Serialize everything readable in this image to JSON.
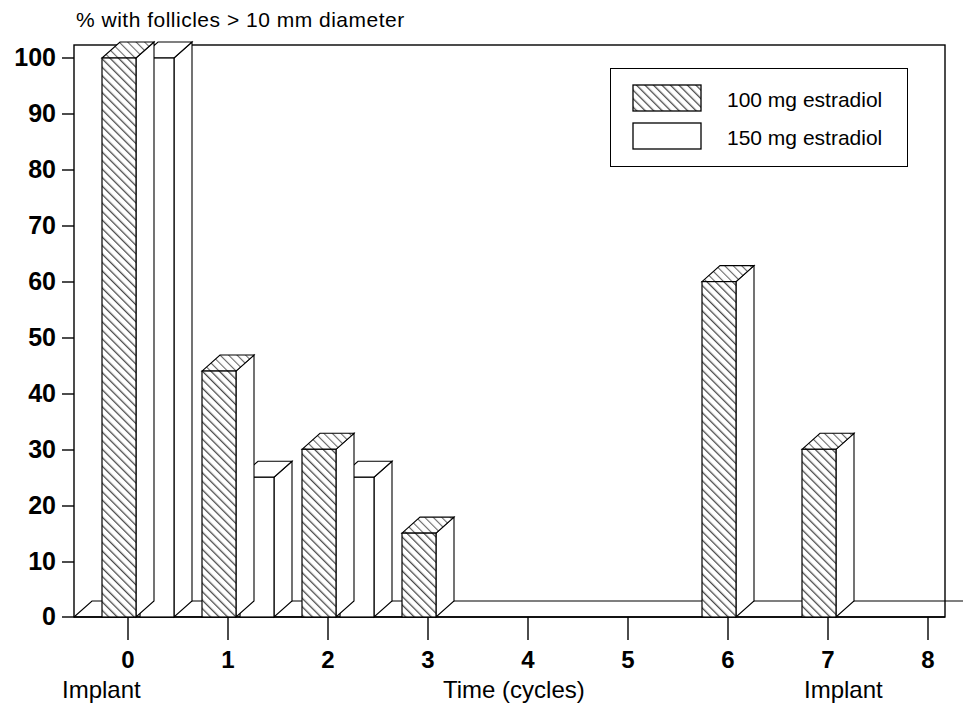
{
  "chart_data": {
    "type": "bar",
    "title": "% with follicles > 10 mm diameter",
    "xlabel": "Time (cycles)",
    "ylabel": "",
    "categories": [
      "0",
      "1",
      "2",
      "3",
      "4",
      "5",
      "6",
      "7",
      "8"
    ],
    "x": [
      0,
      1,
      2,
      3,
      4,
      5,
      6,
      7,
      8
    ],
    "series": [
      {
        "name": "100 mg estradiol",
        "fill": "hatched",
        "values": [
          100,
          44,
          30,
          15,
          0,
          0,
          60,
          30,
          0
        ]
      },
      {
        "name": "150 mg estradiol",
        "fill": "white",
        "values": [
          100,
          25,
          25,
          0,
          0,
          0,
          0,
          0,
          0
        ]
      }
    ],
    "ylim": [
      0,
      100
    ],
    "ytick_values": [
      0,
      10,
      20,
      30,
      40,
      50,
      60,
      70,
      80,
      90,
      100
    ],
    "xlim": [
      -0.5,
      8.5
    ],
    "grid": false,
    "legend_position": "top-right",
    "style": "3d-bars",
    "annotations": [
      {
        "text": "Implant",
        "x": 0
      },
      {
        "text": "Implant",
        "x": 7.5
      }
    ]
  },
  "yaxis": {
    "ticks": [
      "100",
      "90",
      "80",
      "70",
      "60",
      "50",
      "40",
      "30",
      "20",
      "10",
      "0"
    ]
  },
  "xaxis": {
    "ticks": [
      "0",
      "1",
      "2",
      "3",
      "4",
      "5",
      "6",
      "7",
      "8"
    ],
    "caption_center": "Time (cycles)",
    "caption_left": "Implant",
    "caption_right": "Implant"
  },
  "legend": {
    "items": [
      {
        "label": "100 mg estradiol",
        "swatch": "hatched-swatch"
      },
      {
        "label": "150 mg estradiol",
        "swatch": "white-swatch"
      }
    ]
  },
  "colors": {
    "ink": "#000000",
    "background": "#ffffff",
    "bar_face_100": "#ffffff",
    "bar_face_150": "#ffffff",
    "hatch": "#3a3a3a"
  }
}
